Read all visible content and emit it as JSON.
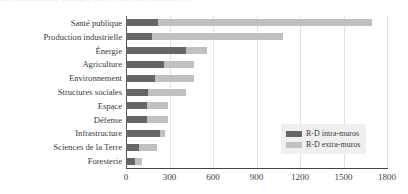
{
  "caption_remnant": "de l'administration publique, par objectif socio-économique",
  "legend": {
    "position": "bottom-right",
    "entries": [
      {
        "label": "R-D intra-muros",
        "color": "#666666",
        "key": "intra"
      },
      {
        "label": "R-D extra-muros",
        "color": "#c0c0c0",
        "key": "extra"
      }
    ]
  },
  "colors": {
    "intra": "#666666",
    "extra": "#c0c0c0",
    "grid": "#e2e2e2",
    "axis": "#444444",
    "legend_bg": "#efefef"
  },
  "chart_data": {
    "type": "bar",
    "orientation": "horizontal",
    "stacked": true,
    "title": "",
    "subtitle": "",
    "xlabel": "",
    "ylabel": "",
    "xlim": [
      0,
      1800
    ],
    "xticks": [
      0,
      300,
      600,
      900,
      1200,
      1500,
      1800
    ],
    "xtick_labels": [
      "0",
      "300",
      "600",
      "900",
      "1200",
      "1500",
      "1800"
    ],
    "grid": "vertical",
    "legend_position": "lower right",
    "categories": [
      "Santé publique",
      "Production industrielle",
      "Énergie",
      "Agriculture",
      "Environnement",
      "Structures sociales",
      "Espace",
      "Défense",
      "Infrastructure",
      "Sciences de la Terre",
      "Foresterie"
    ],
    "series": [
      {
        "name": "R-D intra-muros",
        "color": "#666666",
        "values": [
          220,
          180,
          415,
          265,
          200,
          150,
          145,
          145,
          235,
          90,
          60
        ]
      },
      {
        "name": "R-D extra-muros",
        "color": "#c0c0c0",
        "values": [
          1480,
          900,
          145,
          205,
          270,
          265,
          145,
          145,
          35,
          125,
          50
        ]
      }
    ],
    "totals": [
      1700,
      1080,
      560,
      470,
      470,
      415,
      290,
      290,
      270,
      215,
      110
    ]
  }
}
